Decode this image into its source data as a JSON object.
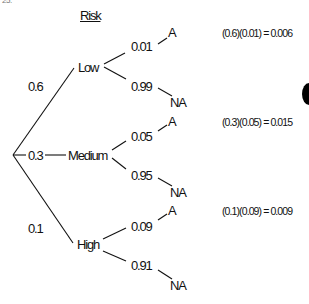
{
  "header_fragment": "25.",
  "title": "Risk",
  "root": {
    "branches": [
      {
        "probability": "0.6",
        "label": "Low",
        "outcomes": [
          {
            "probability": "0.01",
            "label": "A"
          },
          {
            "probability": "0.99",
            "label": "NA"
          }
        ],
        "calculation": "(0.6)(0.01) = 0.006"
      },
      {
        "probability": "0.3",
        "label": "Medium",
        "outcomes": [
          {
            "probability": "0.05",
            "label": "A"
          },
          {
            "probability": "0.95",
            "label": "NA"
          }
        ],
        "calculation": "(0.3)(0.05) = 0.015"
      },
      {
        "probability": "0.1",
        "label": "High",
        "outcomes": [
          {
            "probability": "0.09",
            "label": "A"
          },
          {
            "probability": "0.91",
            "label": "NA"
          }
        ],
        "calculation": "(0.1)(0.09) = 0.009"
      }
    ]
  }
}
